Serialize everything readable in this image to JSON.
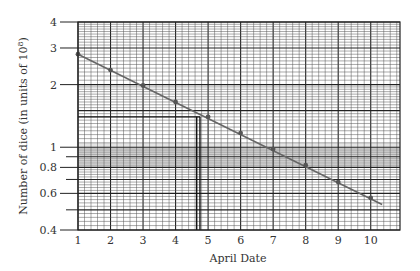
{
  "chart_data": {
    "type": "line",
    "title": "",
    "xlabel": "April Date",
    "ylabel": "Number of dice (in units of 10^8)",
    "ylabel_display": "Number of dice (in units of 10",
    "ylabel_sup": "8",
    "ylabel_tail": ")",
    "yscale": "log",
    "xlim": [
      1,
      10.9
    ],
    "ylim": [
      0.4,
      4
    ],
    "x_ticks": [
      1,
      2,
      3,
      4,
      5,
      6,
      7,
      8,
      9,
      10
    ],
    "x_tick_labels": [
      "1",
      "2",
      "3",
      "4",
      "5",
      "6",
      "7",
      "8",
      "9",
      "10"
    ],
    "y_ticks": [
      4,
      3,
      2,
      1,
      0.9,
      0.8,
      0.7,
      0.6,
      0.5,
      0.4
    ],
    "y_tick_labels": [
      {
        "value": 4,
        "label": "4"
      },
      {
        "value": 3,
        "label": "3"
      },
      {
        "value": 2,
        "label": "2"
      },
      {
        "value": 1,
        "label": "1"
      },
      {
        "value": 0.8,
        "label": "0.8"
      },
      {
        "value": 0.6,
        "label": "0.6"
      },
      {
        "value": 0.4,
        "label": "0.4"
      }
    ],
    "grid": true,
    "legend": null,
    "series": [
      {
        "name": "Number of dice",
        "x": [
          1,
          2,
          3,
          4,
          5,
          6,
          7,
          8,
          9,
          10
        ],
        "values": [
          2.8,
          2.35,
          1.98,
          1.65,
          1.4,
          1.17,
          0.98,
          0.82,
          0.68,
          0.57
        ],
        "color": "#555555",
        "markers": true
      }
    ],
    "fit_line": {
      "x_start": 1,
      "y_start": 2.8,
      "x_end": 10.35,
      "y_end": 0.53
    },
    "annotations": [
      {
        "type": "hline",
        "y": 1.4,
        "x_from": 1,
        "x_to": 4.75,
        "label": ""
      },
      {
        "type": "vline",
        "x": 4.65,
        "y_from": 0.4,
        "y_to": 1.4,
        "label": ""
      },
      {
        "type": "vline",
        "x": 4.75,
        "y_from": 0.4,
        "y_to": 1.4,
        "label": ""
      }
    ],
    "shaded_band": {
      "y_from": 0.8,
      "y_to": 1.05,
      "color": "#d9d9d9"
    }
  }
}
